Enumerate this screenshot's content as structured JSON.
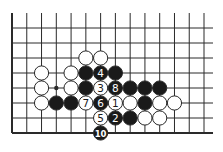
{
  "diagram": {
    "type": "go-board-fragment",
    "grid": {
      "columns": 14,
      "rows": 8,
      "origin_x": 12,
      "origin_y": 28,
      "spacing_x": 14.77,
      "spacing_y": 15,
      "left_edge": true,
      "bottom_edge": true,
      "line_color": "#2a2a2a"
    },
    "star_points": [
      [
        3,
        4
      ]
    ],
    "stones": [
      {
        "col": 5,
        "row": 2,
        "color": "white",
        "label": ""
      },
      {
        "col": 6,
        "row": 2,
        "color": "white",
        "label": ""
      },
      {
        "col": 2,
        "row": 3,
        "color": "white",
        "label": ""
      },
      {
        "col": 4,
        "row": 3,
        "color": "white",
        "label": ""
      },
      {
        "col": 5,
        "row": 3,
        "color": "black",
        "label": ""
      },
      {
        "col": 6,
        "row": 3,
        "color": "black",
        "label": "4"
      },
      {
        "col": 7,
        "row": 3,
        "color": "black",
        "label": ""
      },
      {
        "col": 2,
        "row": 4,
        "color": "white",
        "label": ""
      },
      {
        "col": 4,
        "row": 4,
        "color": "white",
        "label": ""
      },
      {
        "col": 5,
        "row": 4,
        "color": "black",
        "label": ""
      },
      {
        "col": 6,
        "row": 4,
        "color": "white",
        "label": "3"
      },
      {
        "col": 7,
        "row": 4,
        "color": "black",
        "label": "8"
      },
      {
        "col": 8,
        "row": 4,
        "color": "black",
        "label": ""
      },
      {
        "col": 9,
        "row": 4,
        "color": "black",
        "label": ""
      },
      {
        "col": 10,
        "row": 4,
        "color": "black",
        "label": ""
      },
      {
        "col": 2,
        "row": 5,
        "color": "white",
        "label": ""
      },
      {
        "col": 3,
        "row": 5,
        "color": "black",
        "label": ""
      },
      {
        "col": 4,
        "row": 5,
        "color": "black",
        "label": ""
      },
      {
        "col": 5,
        "row": 5,
        "color": "white",
        "label": "7"
      },
      {
        "col": 6,
        "row": 5,
        "color": "black",
        "label": "6"
      },
      {
        "col": 7,
        "row": 5,
        "color": "white",
        "label": "1"
      },
      {
        "col": 8,
        "row": 5,
        "color": "white",
        "label": ""
      },
      {
        "col": 9,
        "row": 5,
        "color": "black",
        "label": ""
      },
      {
        "col": 10,
        "row": 5,
        "color": "white",
        "label": ""
      },
      {
        "col": 11,
        "row": 5,
        "color": "white",
        "label": ""
      },
      {
        "col": 6,
        "row": 6,
        "color": "white",
        "label": "5"
      },
      {
        "col": 7,
        "row": 6,
        "color": "black",
        "label": "2"
      },
      {
        "col": 8,
        "row": 6,
        "color": "black",
        "label": ""
      },
      {
        "col": 9,
        "row": 6,
        "color": "white",
        "label": ""
      },
      {
        "col": 10,
        "row": 6,
        "color": "white",
        "label": ""
      },
      {
        "col": 6,
        "row": 7,
        "color": "black",
        "label": "10"
      }
    ],
    "colors": {
      "black_stone": "#1a1a1a",
      "white_stone": "#ffffff",
      "stone_outline": "#2a2a2a"
    }
  }
}
